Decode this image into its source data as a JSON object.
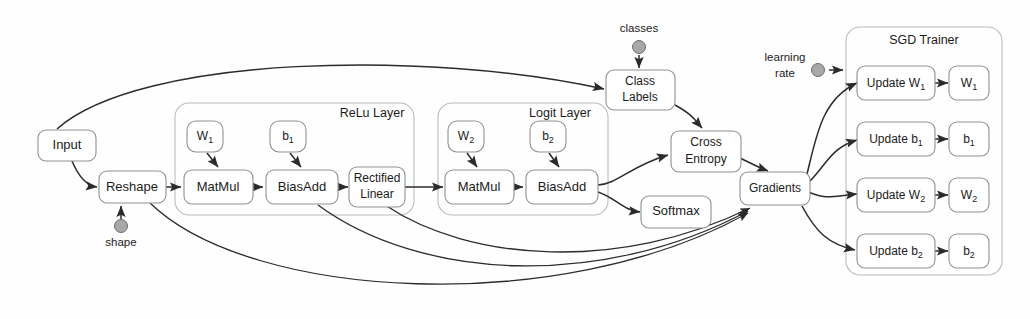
{
  "diagram": {
    "background_color": "#fefefe",
    "node_fill": "#ffffff",
    "node_stroke": "#8f9194",
    "group_stroke": "#b9bcbf",
    "edge_color": "#2b2b2b",
    "source_dot_color": "#a8a8a8"
  },
  "nodes": {
    "input": "Input",
    "reshape": "Reshape",
    "relu_matmul": "MatMul",
    "relu_biasadd": "BiasAdd",
    "rectified_linear_1": "Rectified",
    "rectified_linear_2": "Linear",
    "logit_matmul": "MatMul",
    "logit_biasadd": "BiasAdd",
    "class_labels_1": "Class",
    "class_labels_2": "Labels",
    "cross_entropy_1": "Cross",
    "cross_entropy_2": "Entropy",
    "softmax": "Softmax",
    "gradients": "Gradients",
    "update_w1": "Update W",
    "update_b1": "Update b",
    "update_w2": "Update W",
    "update_b2": "Update b",
    "var_w1": "W",
    "var_b1": "b",
    "var_w2": "W",
    "var_b2": "b",
    "relu_w1": "W",
    "relu_b1": "b",
    "logit_w2": "W",
    "logit_b2": "b",
    "sub_1": "1",
    "sub_2": "2"
  },
  "groups": {
    "relu_layer": "ReLu Layer",
    "logit_layer": "Logit Layer",
    "sgd_trainer": "SGD Trainer"
  },
  "sources": {
    "shape": "shape",
    "classes": "classes",
    "learning_rate_1": "learning",
    "learning_rate_2": "rate"
  },
  "edges": [
    {
      "from": "Input",
      "to": "Reshape"
    },
    {
      "from": "Input",
      "to": "Class Labels"
    },
    {
      "from": "shape",
      "to": "Reshape"
    },
    {
      "from": "Reshape",
      "to": "MatMul (ReLu)"
    },
    {
      "from": "W1",
      "to": "MatMul (ReLu)"
    },
    {
      "from": "MatMul (ReLu)",
      "to": "BiasAdd (ReLu)"
    },
    {
      "from": "b1",
      "to": "BiasAdd (ReLu)"
    },
    {
      "from": "BiasAdd (ReLu)",
      "to": "Rectified Linear"
    },
    {
      "from": "Rectified Linear",
      "to": "MatMul (Logit)"
    },
    {
      "from": "W2",
      "to": "MatMul (Logit)"
    },
    {
      "from": "MatMul (Logit)",
      "to": "BiasAdd (Logit)"
    },
    {
      "from": "b2",
      "to": "BiasAdd (Logit)"
    },
    {
      "from": "BiasAdd (Logit)",
      "to": "Cross Entropy"
    },
    {
      "from": "BiasAdd (Logit)",
      "to": "Softmax"
    },
    {
      "from": "classes",
      "to": "Class Labels"
    },
    {
      "from": "Class Labels",
      "to": "Cross Entropy"
    },
    {
      "from": "Cross Entropy",
      "to": "Gradients"
    },
    {
      "from": "Reshape",
      "to": "Gradients"
    },
    {
      "from": "BiasAdd (ReLu)",
      "to": "Gradients"
    },
    {
      "from": "Rectified Linear",
      "to": "Gradients"
    },
    {
      "from": "Gradients",
      "to": "Update W1"
    },
    {
      "from": "Gradients",
      "to": "Update b1"
    },
    {
      "from": "Gradients",
      "to": "Update W2"
    },
    {
      "from": "Gradients",
      "to": "Update b2"
    },
    {
      "from": "learning rate",
      "to": "SGD Trainer"
    },
    {
      "from": "Update W1",
      "to": "W1"
    },
    {
      "from": "Update b1",
      "to": "b1"
    },
    {
      "from": "Update W2",
      "to": "W2"
    },
    {
      "from": "Update b2",
      "to": "b2"
    }
  ]
}
